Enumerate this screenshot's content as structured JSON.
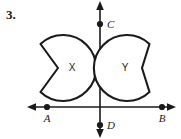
{
  "figure": {
    "problem_number": "3.",
    "type": "coordinate-plane-with-two-notched-circle-regions",
    "background_color": "#ffffff",
    "ink_color": "#1a1a1a",
    "axes": {
      "vertical_axis_label": "y-axis",
      "horizontal_axis_label": "x-axis",
      "origin_x": 100,
      "origin_y": 107,
      "vertical_from_y": 3,
      "vertical_to_y": 139,
      "horizontal_from_x": 28,
      "horizontal_to_x": 176,
      "arrowheads": [
        "up",
        "down",
        "left",
        "right"
      ]
    },
    "points": [
      {
        "label": "A",
        "x": 47,
        "y": 107,
        "label_x": 44,
        "label_y": 121,
        "on": "x-axis-left"
      },
      {
        "label": "B",
        "x": 162,
        "y": 107,
        "label_x": 159,
        "label_y": 121,
        "on": "x-axis-right"
      },
      {
        "label": "C",
        "x": 100,
        "y": 24,
        "label_x": 107,
        "label_y": 27,
        "on": "y-axis-up"
      },
      {
        "label": "D",
        "x": 100,
        "y": 125,
        "label_x": 107,
        "label_y": 129,
        "on": "y-axis-down"
      }
    ],
    "regions": [
      {
        "label": "X",
        "description": "circle with V-shaped notch cut from its left side",
        "center_x": 62,
        "center_y": 68,
        "radius": 33,
        "notch_side": "left",
        "notch_vertex_x": 58,
        "notch_vertex_y": 68,
        "label_x": 72,
        "label_y": 71,
        "quadrant": "second"
      },
      {
        "label": "Y",
        "description": "circle with V-shaped notch cut from its right side",
        "center_x": 128,
        "center_y": 68,
        "radius": 33,
        "notch_side": "right",
        "notch_vertex_x": 142,
        "notch_vertex_y": 68,
        "label_x": 125,
        "label_y": 71,
        "quadrant": "first"
      }
    ]
  }
}
